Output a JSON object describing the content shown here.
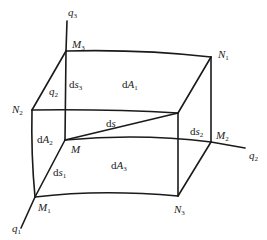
{
  "diagram": {
    "title": "",
    "axes": {
      "q1": {
        "name": "q",
        "sub": "1"
      },
      "q2": {
        "name": "q",
        "sub": "2"
      },
      "q3": {
        "name": "q",
        "sub": "3"
      }
    },
    "points": {
      "M": {
        "name": "M",
        "sub": ""
      },
      "M1": {
        "name": "M",
        "sub": "1"
      },
      "M2": {
        "name": "M",
        "sub": "2"
      },
      "M3": {
        "name": "M",
        "sub": "3"
      },
      "N1": {
        "name": "N",
        "sub": "1"
      },
      "N2": {
        "name": "N",
        "sub": "2"
      },
      "N3": {
        "name": "N",
        "sub": "3"
      }
    },
    "edge_labels": {
      "ds": {
        "prefix": "d",
        "name": "s",
        "sub": ""
      },
      "ds1": {
        "prefix": "d",
        "name": "s",
        "sub": "1"
      },
      "ds2": {
        "prefix": "d",
        "name": "s",
        "sub": "2"
      },
      "ds3": {
        "prefix": "d",
        "name": "s",
        "sub": "3"
      },
      "q2_edge": {
        "name": "q",
        "sub": "2"
      }
    },
    "area_labels": {
      "dA1": {
        "prefix": "d",
        "name": "A",
        "sub": "1"
      },
      "dA2": {
        "prefix": "d",
        "name": "A",
        "sub": "2"
      },
      "dA3": {
        "prefix": "d",
        "name": "A",
        "sub": "3"
      }
    }
  }
}
